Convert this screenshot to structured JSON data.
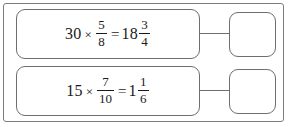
{
  "worksheet": {
    "rows": [
      {
        "id": "row-1",
        "equation": {
          "multiplicand": "30",
          "operator": "×",
          "multiplier": {
            "numerator": "5",
            "denominator": "8"
          },
          "equals": "=",
          "result": {
            "whole": "18",
            "numerator": "3",
            "denominator": "4"
          },
          "plain_text": "30 × 5/8 = 18 3/4"
        },
        "answer_box": {
          "value": "",
          "empty": true
        }
      },
      {
        "id": "row-2",
        "equation": {
          "multiplicand": "15",
          "operator": "×",
          "multiplier": {
            "numerator": "7",
            "denominator": "10"
          },
          "equals": "=",
          "result": {
            "whole": "1",
            "numerator": "1",
            "denominator": "6"
          },
          "plain_text": "15 × 7/10 = 1 1/6"
        },
        "answer_box": {
          "value": "",
          "empty": true
        }
      }
    ]
  },
  "style": {
    "border_color": "#6e6e73",
    "frame_color": "#7c7c80",
    "text_color": "#1a1a1a",
    "background": "#ffffff"
  }
}
